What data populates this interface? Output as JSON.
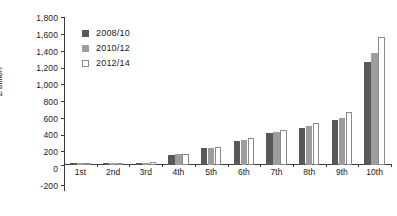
{
  "chart_data": {
    "type": "bar",
    "title": "",
    "subtitle": "",
    "xlabel": "",
    "ylabel": "£ billion",
    "grid": false,
    "legend_position": "top-left",
    "ylim": [
      -200,
      1800
    ],
    "ytick_step": 200,
    "yticks": [
      "1,800",
      "1,600",
      "1,400",
      "1,200",
      "1,000",
      "800",
      "600",
      "400",
      "200",
      "0",
      "-200"
    ],
    "ytick_values": [
      1800,
      1600,
      1400,
      1200,
      1000,
      800,
      600,
      400,
      200,
      0,
      -200
    ],
    "categories": [
      "1st",
      "2nd",
      "3rd",
      "4th",
      "5th",
      "6th",
      "7th",
      "8th",
      "9th",
      "10th"
    ],
    "series": [
      {
        "name": "2008/10",
        "color": "#58585a",
        "values": [
          2,
          4,
          18,
          120,
          200,
          290,
          380,
          450,
          540,
          1250
        ]
      },
      {
        "name": "2010/12",
        "color": "#9d9d9f",
        "values": [
          2,
          5,
          22,
          125,
          205,
          300,
          395,
          470,
          570,
          1360
        ]
      },
      {
        "name": "2012/14",
        "color": "#ffffff",
        "border_color": "#8a8a8a",
        "values": [
          2,
          6,
          28,
          130,
          215,
          320,
          420,
          510,
          640,
          1560
        ]
      }
    ]
  }
}
